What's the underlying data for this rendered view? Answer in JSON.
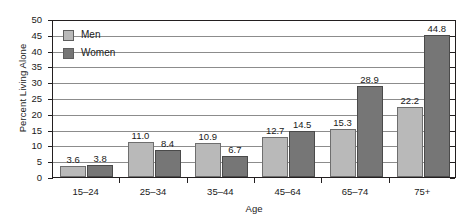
{
  "chart_data": {
    "type": "bar",
    "title": "",
    "xlabel": "Age",
    "ylabel": "Percent Living Alone",
    "categories": [
      "15–24",
      "25–34",
      "35–44",
      "45–64",
      "65–74",
      "75+"
    ],
    "series": [
      {
        "name": "Men",
        "color": "#b9b9b9",
        "values": [
          3.6,
          11.0,
          10.9,
          12.7,
          15.3,
          22.2
        ]
      },
      {
        "name": "Women",
        "color": "#767676",
        "values": [
          3.8,
          8.4,
          6.7,
          14.5,
          28.9,
          44.8
        ]
      }
    ],
    "value_labels": [
      [
        "3.6",
        "11.0",
        "10.9",
        "12.7",
        "15.3",
        "22.2"
      ],
      [
        "3.8",
        "8.4",
        "6.7",
        "14.5",
        "28.9",
        "44.8"
      ]
    ],
    "ylim": [
      0,
      50
    ],
    "yticks": [
      0,
      5,
      10,
      15,
      20,
      25,
      30,
      35,
      40,
      45,
      50
    ],
    "ytick_labels": [
      "0",
      "5",
      "10",
      "15",
      "20",
      "25",
      "30",
      "35",
      "40",
      "45",
      "50"
    ],
    "grid": true,
    "grid_orientation": "horizontal",
    "legend_position": "upper-left-inside",
    "legend": [
      "Men",
      "Women"
    ]
  },
  "axes": {
    "x_title": "Age",
    "y_title": "Percent Living Alone"
  },
  "colors": {
    "men": "#b9b9b9",
    "women": "#767676",
    "axis": "#231f20",
    "grid": "#8c8c8c",
    "text": "#1a1a1a",
    "background": "#ffffff"
  }
}
